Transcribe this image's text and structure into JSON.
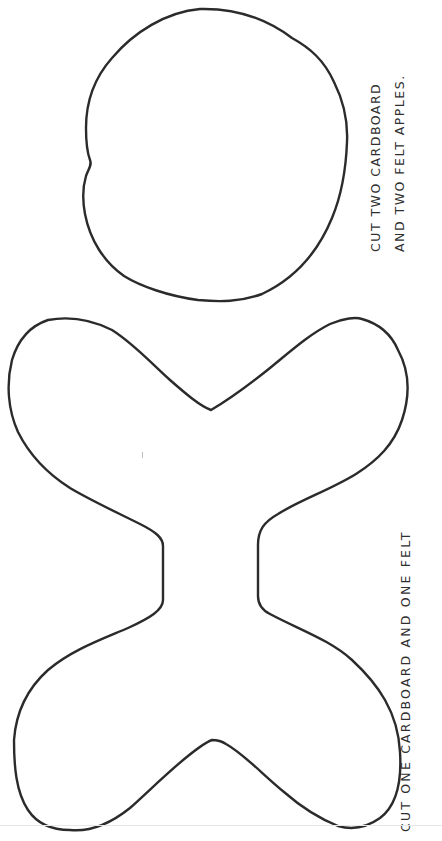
{
  "document": {
    "type": "craft-cutout-template",
    "orientation": "rotated-90-ccw",
    "colors": {
      "background": "#ffffff",
      "outline": "#2b2b2b",
      "text": "#2f2f2f"
    }
  },
  "apple_template": {
    "shape": "apple-outline",
    "instruction": {
      "line1": "CUT TWO CARDBOARD",
      "line2": "AND TWO FELT APPLES."
    }
  },
  "bowtie_template": {
    "shape": "bow-tie-outline",
    "instruction": {
      "line1": "CUT ONE CARDBOARD AND ONE FELT"
    }
  }
}
